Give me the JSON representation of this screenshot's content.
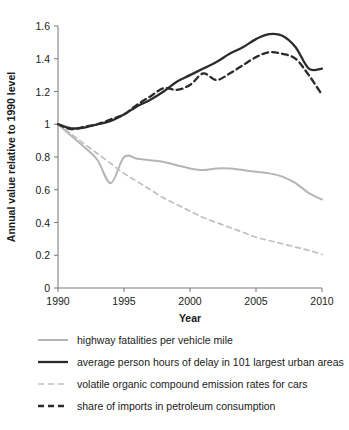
{
  "chart_data": {
    "type": "line",
    "title": "",
    "xlabel": "Year",
    "ylabel": "Annual value relative to 1990 level",
    "xlim": [
      1990,
      2010
    ],
    "ylim": [
      0,
      1.6
    ],
    "grid": false,
    "legend_position": "below",
    "x_ticks": [
      "1990",
      "1995",
      "2000",
      "2005",
      "2010"
    ],
    "x_tick_values": [
      1990,
      1995,
      2000,
      2005,
      2010
    ],
    "y_ticks": [
      "0",
      "0.2",
      "0.4",
      "0.6",
      "0.8",
      "1",
      "1.2",
      "1.4",
      "1.6"
    ],
    "y_tick_values": [
      0,
      0.2,
      0.4,
      0.6,
      0.8,
      1.0,
      1.2,
      1.4,
      1.6
    ],
    "x": [
      1990,
      1991,
      1992,
      1993,
      1994,
      1995,
      1996,
      1997,
      1998,
      1999,
      2000,
      2001,
      2002,
      2003,
      2004,
      2005,
      2006,
      2007,
      2008,
      2009,
      2010
    ],
    "series": [
      {
        "name": "highway fatalities per vehicle mile",
        "color": "#b5b5b5",
        "style": "solid",
        "width": 2.0,
        "values": [
          1.0,
          0.93,
          0.86,
          0.78,
          0.64,
          0.8,
          0.79,
          0.78,
          0.77,
          0.75,
          0.73,
          0.72,
          0.73,
          0.73,
          0.72,
          0.71,
          0.7,
          0.68,
          0.64,
          0.58,
          0.54
        ]
      },
      {
        "name": "average person hours of delay in 101 largest urban areas",
        "color": "#2b2b2b",
        "style": "solid",
        "width": 2.3,
        "values": [
          1.0,
          0.975,
          0.98,
          1.0,
          1.02,
          1.06,
          1.11,
          1.15,
          1.2,
          1.26,
          1.3,
          1.34,
          1.38,
          1.43,
          1.47,
          1.52,
          1.55,
          1.54,
          1.47,
          1.34,
          1.34
        ]
      },
      {
        "name": "volatile organic compound emission rates for cars",
        "color": "#c0c0c0",
        "style": "dashed",
        "width": 1.7,
        "values": [
          1.0,
          0.94,
          0.88,
          0.82,
          0.76,
          0.7,
          0.65,
          0.6,
          0.55,
          0.51,
          0.47,
          0.43,
          0.4,
          0.37,
          0.34,
          0.31,
          0.29,
          0.27,
          0.25,
          0.23,
          0.205
        ]
      },
      {
        "name": "share of imports in petroleum consumption",
        "color": "#2b2b2b",
        "style": "dashed",
        "width": 2.3,
        "values": [
          1.0,
          0.97,
          0.985,
          1.0,
          1.03,
          1.06,
          1.12,
          1.17,
          1.22,
          1.21,
          1.24,
          1.31,
          1.27,
          1.31,
          1.36,
          1.41,
          1.44,
          1.43,
          1.4,
          1.3,
          1.18
        ]
      }
    ]
  },
  "axis": {
    "ylabel": "Annual value relative to 1990 level",
    "xlabel": "Year"
  },
  "legend": {
    "items": [
      {
        "label": "highway fatalities per vehicle mile"
      },
      {
        "label": "average person hours of delay in 101 largest urban areas"
      },
      {
        "label": "volatile organic compound emission rates for cars"
      },
      {
        "label": "share of imports in petroleum consumption"
      }
    ]
  },
  "colors": {
    "light_gray": "#b5b5b5",
    "near_black": "#2b2b2b",
    "axis_gray": "#808080",
    "background": "#ffffff"
  }
}
